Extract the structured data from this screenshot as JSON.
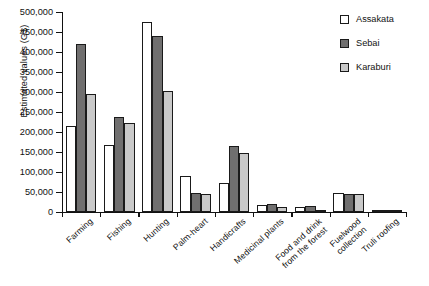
{
  "chart_data": {
    "type": "bar",
    "title": "",
    "xlabel": "",
    "ylabel": "Estimated values (G$)",
    "ylim": [
      0,
      500000
    ],
    "ytick_step": 50000,
    "grid": false,
    "legend_position": "top-right",
    "categories": [
      "Farming",
      "Fishing",
      "Hunting",
      "Palm-heart",
      "Handicrafts",
      "Medicinal plants",
      "Food and drink from the forest",
      "Fuelwood collection",
      "Truli roofing"
    ],
    "category_lines": [
      [
        "Farming"
      ],
      [
        "Fishing"
      ],
      [
        "Hunting"
      ],
      [
        "Palm-heart"
      ],
      [
        "Handicrafts"
      ],
      [
        "Medicinal plants"
      ],
      [
        "Food and drink",
        "from the forest"
      ],
      [
        "Fuelwood",
        "collection"
      ],
      [
        "Truli roofing"
      ]
    ],
    "ytick_labels": [
      "0",
      "50,000",
      "100,000",
      "150,000",
      "200,000",
      "250,000",
      "300,000",
      "350,000",
      "400,000",
      "450,000",
      "500,000"
    ],
    "ytick_values": [
      0,
      50000,
      100000,
      150000,
      200000,
      250000,
      300000,
      350000,
      400000,
      450000,
      500000
    ],
    "series": [
      {
        "name": "Assakata",
        "color": "#ffffff",
        "values": [
          215000,
          168000,
          475000,
          91000,
          72000,
          18000,
          12000,
          47000,
          2000
        ]
      },
      {
        "name": "Sebai",
        "color": "#706f6f",
        "values": [
          421000,
          238000,
          441000,
          48000,
          165000,
          21000,
          14000,
          44000,
          1500
        ]
      },
      {
        "name": "Karaburi",
        "color": "#c9c9c9",
        "values": [
          296000,
          223000,
          303000,
          44000,
          148000,
          13000,
          6000,
          45000,
          1200
        ]
      }
    ]
  },
  "legend": {
    "items": [
      {
        "label": "Assakata",
        "swatch": "legend-swatch-assakata"
      },
      {
        "label": "Sebai",
        "swatch": "legend-swatch-sebai"
      },
      {
        "label": "Karaburi",
        "swatch": "legend-swatch-karaburi"
      }
    ]
  }
}
